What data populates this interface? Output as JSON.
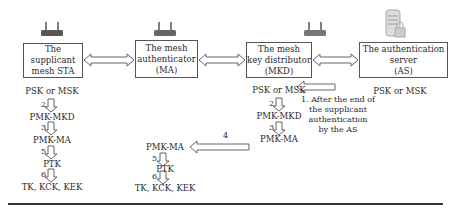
{
  "entities": [
    {
      "id": "sta",
      "lines": [
        "The supplicant",
        "mesh STA"
      ],
      "icon": "router-icon"
    },
    {
      "id": "ma",
      "lines": [
        "The mesh",
        "authenticator",
        "(MA)"
      ],
      "icon": "router-icon"
    },
    {
      "id": "mkd",
      "lines": [
        "The mesh",
        "key distributor",
        "(MKD)"
      ],
      "icon": "router-icon"
    },
    {
      "id": "as",
      "lines": [
        "The authentication",
        "server",
        "(AS)"
      ],
      "icon": "server-lock-icon"
    }
  ],
  "sta_chain": {
    "keys": [
      "PSK or MSK",
      "PMK-MKD",
      "PMK-MA",
      "PTK",
      "TK, KCK, KEK"
    ],
    "steps": [
      "2",
      "3",
      "5",
      "6"
    ]
  },
  "mkd_chain": {
    "keys": [
      "PSK or MSK",
      "PMK-MKD",
      "PMK-MA"
    ],
    "steps": [
      "2",
      "3"
    ]
  },
  "ma_chain": {
    "keys": [
      "PMK-MA",
      "PTK",
      "TK, KCK, KEK"
    ],
    "steps": [
      "5",
      "6"
    ]
  },
  "as_key": "PSK or MSK",
  "note_1": [
    "1. After the end of",
    "the supplicant",
    "authentication",
    "by the AS"
  ],
  "step_4": "4",
  "colors": {
    "line": "#555555",
    "text": "#2a2a2a",
    "router": "#555555"
  }
}
